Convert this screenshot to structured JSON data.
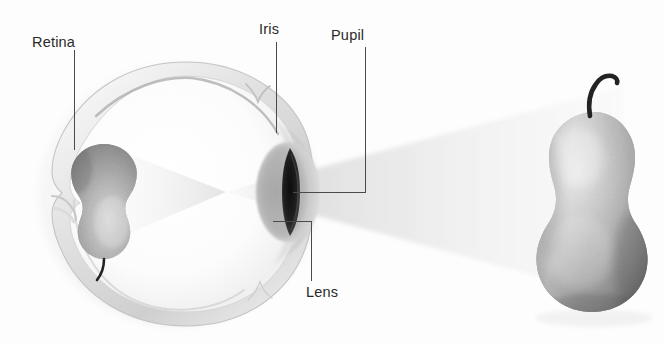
{
  "diagram": {
    "background_color": "#fdfdfd",
    "line_color": "#4a4a4a",
    "text_color": "#2a2a2a"
  },
  "labels": {
    "retina": "Retina",
    "iris": "Iris",
    "pupil": "Pupil",
    "lens": "Lens"
  },
  "objects": {
    "pear_external": "pear",
    "pear_retinal_image": "inverted-pear",
    "eye": "eye-cross-section",
    "light_cone_external": "light-rays-object-to-pupil",
    "light_cone_internal": "light-rays-pupil-to-retina"
  },
  "colors": {
    "sclera_fill": "#f2f2f2",
    "sclera_edge": "#c9c9c9",
    "vitreous_fill": "#fbfbfb",
    "cornea_fill": "#b9b9b9",
    "pupil_fill": "#1d1d1d",
    "pear_body_light": "#d8d8d8",
    "pear_body_mid": "#a8a8a8",
    "pear_body_dark": "#6e6e6e",
    "pear_stem": "#232323",
    "ray_fill": "#e9e9e9",
    "leader_line": "#4a4a4a"
  }
}
